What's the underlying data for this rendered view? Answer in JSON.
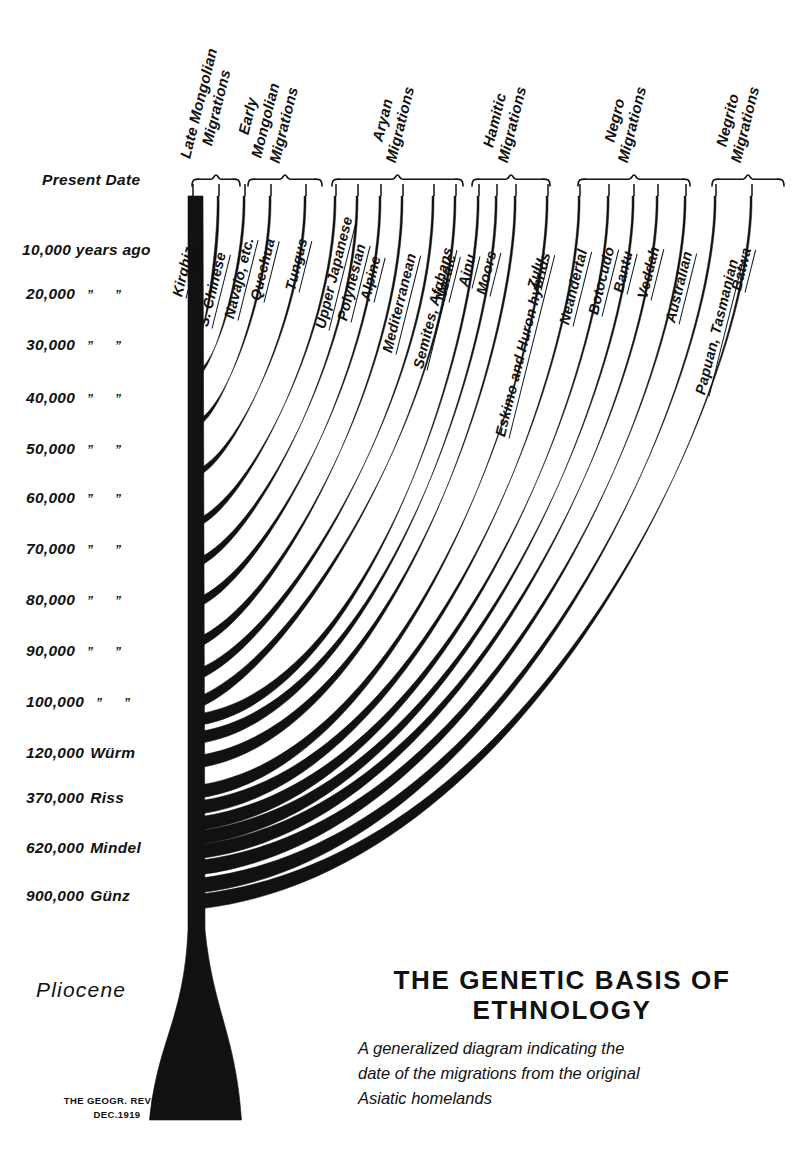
{
  "figure": {
    "title_line1": "THE GENETIC BASIS OF",
    "title_line2": "ETHNOLOGY",
    "subtitle_line1": "A generalized  diagram  indicating  the",
    "subtitle_line2": "date of the migrations from the original",
    "subtitle_line3": "Asiatic homelands",
    "credit_line1": "THE GEOGR. REVIEW",
    "credit_line2": "DEC.1919",
    "pliocene_label": "Pliocene",
    "ink_color": "#111111",
    "background_color": "#ffffff"
  },
  "chart_data": {
    "type": "diagram",
    "title": "THE GENETIC BASIS OF ETHNOLOGY",
    "subtitle": "A generalized diagram indicating the date of the migrations from the original Asiatic homelands",
    "ylabel": "Years before present",
    "axis_ticks": [
      {
        "label": "Present Date",
        "number": "",
        "ditto1": "",
        "ditto2": "",
        "glacial": "",
        "y": 182
      },
      {
        "label": "10,000 years ago",
        "number": "10,000",
        "ditto1": "years",
        "ditto2": "ago",
        "glacial": "",
        "y": 252
      },
      {
        "label": "20,000",
        "number": "20,000",
        "ditto1": "”",
        "ditto2": "”",
        "glacial": "",
        "y": 296
      },
      {
        "label": "30,000",
        "number": "30,000",
        "ditto1": "”",
        "ditto2": "”",
        "glacial": "",
        "y": 347
      },
      {
        "label": "40,000",
        "number": "40,000",
        "ditto1": "”",
        "ditto2": "”",
        "glacial": "",
        "y": 400
      },
      {
        "label": "50,000",
        "number": "50,000",
        "ditto1": "”",
        "ditto2": "”",
        "glacial": "",
        "y": 451
      },
      {
        "label": "60,000",
        "number": "60,000",
        "ditto1": "”",
        "ditto2": "”",
        "glacial": "",
        "y": 500
      },
      {
        "label": "70,000",
        "number": "70,000",
        "ditto1": "”",
        "ditto2": "”",
        "glacial": "",
        "y": 551
      },
      {
        "label": "80,000",
        "number": "80,000",
        "ditto1": "”",
        "ditto2": "”",
        "glacial": "",
        "y": 602
      },
      {
        "label": "90,000",
        "number": "90,000",
        "ditto1": "”",
        "ditto2": "”",
        "glacial": "",
        "y": 653
      },
      {
        "label": "100,000",
        "number": "100,000",
        "ditto1": "”",
        "ditto2": "”",
        "glacial": "",
        "y": 704
      },
      {
        "label": "120,000 Würm",
        "number": "120,000",
        "ditto1": "",
        "ditto2": "",
        "glacial": "Würm",
        "y": 755
      },
      {
        "label": "370,000 Riss",
        "number": "370,000",
        "ditto1": "",
        "ditto2": "",
        "glacial": "Riss",
        "y": 800
      },
      {
        "label": "620,000 Mindel",
        "number": "620,000",
        "ditto1": "",
        "ditto2": "",
        "glacial": "Mindel",
        "y": 850
      },
      {
        "label": "900,000 Günz",
        "number": "900,000",
        "ditto1": "",
        "ditto2": "",
        "glacial": "Günz",
        "y": 898
      }
    ],
    "groups": [
      {
        "name": "Late Mongolian Migrations",
        "line1": "Late Mongolian",
        "line2": "Migrations",
        "x_start": 192,
        "x_end": 240,
        "label_x": 212,
        "label_y": 168
      },
      {
        "name": "Early Mongolian Migrations",
        "line1": "Early",
        "line2": "Mongolian",
        "line3": "Migrations",
        "x_start": 248,
        "x_end": 322,
        "label_x": 283,
        "label_y": 168
      },
      {
        "name": "Aryan Migrations",
        "line1": "Aryan",
        "line2": "Migrations",
        "x_start": 332,
        "x_end": 463,
        "label_x": 400,
        "label_y": 168
      },
      {
        "name": "Hamitic Migrations",
        "line1": "Hamitic",
        "line2": "Migrations",
        "x_start": 472,
        "x_end": 550,
        "label_x": 512,
        "label_y": 168
      },
      {
        "name": "Negro Migrations",
        "line1": "Negro",
        "line2": "Migrations",
        "x_start": 578,
        "x_end": 690,
        "label_x": 632,
        "label_y": 168
      },
      {
        "name": "Negrito Migrations",
        "line1": "Negrito",
        "line2": "Migrations",
        "x_start": 712,
        "x_end": 784,
        "label_x": 745,
        "label_y": 168
      },
      {
        "name": "Unbracketed",
        "line1": "",
        "line2": "",
        "x_start": 0,
        "x_end": 0,
        "label_x": 0,
        "label_y": 0
      }
    ],
    "branches": [
      {
        "label": "Kirghiz",
        "tip_x": 193,
        "tip_y": 196,
        "split_y": 286,
        "label_angle": -76,
        "label_x": 186,
        "label_y": 296
      },
      {
        "label": "S. Chinese",
        "tip_x": 219,
        "tip_y": 196,
        "split_y": 330,
        "label_angle": -76,
        "label_x": 212,
        "label_y": 326
      },
      {
        "label": "Navajo, etc.",
        "tip_x": 245,
        "tip_y": 196,
        "split_y": 370,
        "label_angle": -76,
        "label_x": 238,
        "label_y": 318
      },
      {
        "label": "Quechua",
        "tip_x": 271,
        "tip_y": 196,
        "split_y": 420,
        "label_angle": -76,
        "label_x": 264,
        "label_y": 300
      },
      {
        "label": "Tungus",
        "tip_x": 306,
        "tip_y": 196,
        "split_y": 470,
        "label_angle": -76,
        "label_x": 299,
        "label_y": 290
      },
      {
        "label": "Upper Japanese",
        "tip_x": 336,
        "tip_y": 196,
        "split_y": 520,
        "label_angle": -76,
        "label_x": 329,
        "label_y": 328
      },
      {
        "label": "Polynesian",
        "tip_x": 358,
        "tip_y": 196,
        "split_y": 560,
        "label_angle": -76,
        "label_x": 351,
        "label_y": 320
      },
      {
        "label": "Alpine",
        "tip_x": 381,
        "tip_y": 196,
        "split_y": 600,
        "label_angle": -76,
        "label_x": 374,
        "label_y": 300
      },
      {
        "label": "Mediterranean",
        "tip_x": 403,
        "tip_y": 196,
        "split_y": 640,
        "label_angle": -76,
        "label_x": 396,
        "label_y": 352
      },
      {
        "label": "Semites, Afghans",
        "tip_x": 434,
        "tip_y": 196,
        "split_y": 672,
        "label_angle": -76,
        "label_x": 427,
        "label_y": 368
      },
      {
        "label": "Nordic",
        "tip_x": 456,
        "tip_y": 196,
        "split_y": 700,
        "label_angle": -76,
        "label_x": 449,
        "label_y": 300
      },
      {
        "label": "Ainu",
        "tip_x": 479,
        "tip_y": 196,
        "split_y": 718,
        "label_angle": -76,
        "label_x": 472,
        "label_y": 286
      },
      {
        "label": "Moors",
        "tip_x": 497,
        "tip_y": 196,
        "split_y": 736,
        "label_angle": -76,
        "label_x": 490,
        "label_y": 294
      },
      {
        "label": "Eskimo and Huron hybrids",
        "tip_x": 516,
        "tip_y": 196,
        "split_y": 760,
        "label_angle": -76,
        "label_x": 509,
        "label_y": 436
      },
      {
        "label": "Zulu",
        "tip_x": 548,
        "tip_y": 196,
        "split_y": 790,
        "label_angle": -76,
        "label_x": 541,
        "label_y": 288
      },
      {
        "label": "Neandertal",
        "tip_x": 580,
        "tip_y": 196,
        "split_y": 806,
        "label_angle": -76,
        "label_x": 573,
        "label_y": 324
      },
      {
        "label": "Botocudo",
        "tip_x": 609,
        "tip_y": 196,
        "split_y": 822,
        "label_angle": -76,
        "label_x": 602,
        "label_y": 314
      },
      {
        "label": "Bantu",
        "tip_x": 634,
        "tip_y": 196,
        "split_y": 836,
        "label_angle": -76,
        "label_x": 627,
        "label_y": 292
      },
      {
        "label": "Veddah",
        "tip_x": 658,
        "tip_y": 196,
        "split_y": 850,
        "label_angle": -76,
        "label_x": 651,
        "label_y": 298
      },
      {
        "label": "Australian",
        "tip_x": 686,
        "tip_y": 196,
        "split_y": 866,
        "label_angle": -76,
        "label_x": 679,
        "label_y": 322
      },
      {
        "label": "Papuan, Tasmanian",
        "tip_x": 716,
        "tip_y": 196,
        "split_y": 884,
        "label_angle": -76,
        "label_x": 709,
        "label_y": 394
      },
      {
        "label": "Batwa",
        "tip_x": 752,
        "tip_y": 196,
        "split_y": 900,
        "label_angle": -76,
        "label_x": 745,
        "label_y": 290
      }
    ],
    "trunk": {
      "x_left": 188,
      "x_right": 203,
      "top_y": 196,
      "base_y": 1120,
      "base_half_width": 46
    }
  }
}
